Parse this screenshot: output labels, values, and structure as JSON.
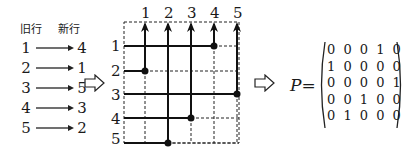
{
  "mapping": {
    "header_old": "旧行",
    "header_new": "新行",
    "rows": [
      {
        "from": "1",
        "to": "4"
      },
      {
        "from": "2",
        "to": "1"
      },
      {
        "from": "3",
        "to": "5"
      },
      {
        "from": "4",
        "to": "3"
      },
      {
        "from": "5",
        "to": "2"
      }
    ]
  },
  "grid": {
    "column_labels": [
      "1",
      "2",
      "3",
      "4",
      "5"
    ],
    "row_labels": [
      "1",
      "2",
      "3",
      "4",
      "5"
    ]
  },
  "matrix": {
    "label": "P=",
    "rows": [
      "0 0 0 1 0",
      "1 0 0 0 0",
      "0 0 0 0 1",
      "0 0 1 0 0",
      "0 1 0 0 0"
    ]
  },
  "icons": {
    "implies_arrow_1": "hollow-right-arrow",
    "implies_arrow_2": "hollow-right-arrow"
  }
}
